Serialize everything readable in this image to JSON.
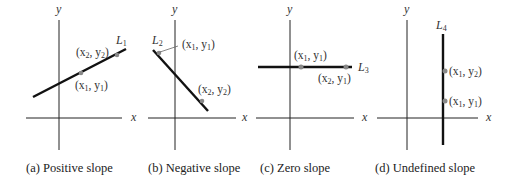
{
  "figure": {
    "panels": [
      {
        "id": "a",
        "caption": "(a) Positive slope",
        "line_name": "L",
        "line_sub": "1",
        "points": [
          {
            "label_a": "(x",
            "sub_a": "1",
            "label_b": ", y",
            "sub_b": "1",
            "label_c": ")"
          },
          {
            "label_a": "(x",
            "sub_a": "2",
            "label_b": ", y",
            "sub_b": "2",
            "label_c": ")"
          }
        ],
        "x_axis_label": "x",
        "y_axis_label": "y"
      },
      {
        "id": "b",
        "caption": "(b) Negative slope",
        "line_name": "L",
        "line_sub": "2",
        "points": [
          {
            "label_a": "(x",
            "sub_a": "1",
            "label_b": ", y",
            "sub_b": "1",
            "label_c": ")"
          },
          {
            "label_a": "(x",
            "sub_a": "2",
            "label_b": ", y",
            "sub_b": "2",
            "label_c": ")"
          }
        ],
        "x_axis_label": "x",
        "y_axis_label": "y"
      },
      {
        "id": "c",
        "caption": "(c) Zero slope",
        "line_name": "L",
        "line_sub": "3",
        "points": [
          {
            "label_a": "(x",
            "sub_a": "1",
            "label_b": ", y",
            "sub_b": "1",
            "label_c": ")"
          },
          {
            "label_a": "(x",
            "sub_a": "2",
            "label_b": ", y",
            "sub_b": "1",
            "label_c": ")"
          }
        ],
        "x_axis_label": "x",
        "y_axis_label": "y"
      },
      {
        "id": "d",
        "caption": "(d) Undefined slope",
        "line_name": "L",
        "line_sub": "4",
        "points": [
          {
            "label_a": "(x",
            "sub_a": "1",
            "label_b": ", y",
            "sub_b": "1",
            "label_c": ")"
          },
          {
            "label_a": "(x",
            "sub_a": "1",
            "label_b": ", y",
            "sub_b": "2",
            "label_c": ")"
          }
        ],
        "x_axis_label": "x",
        "y_axis_label": "y"
      }
    ],
    "colors": {
      "axis": "#222222",
      "line": "#111111",
      "point": "#888888",
      "text": "#333333"
    }
  }
}
